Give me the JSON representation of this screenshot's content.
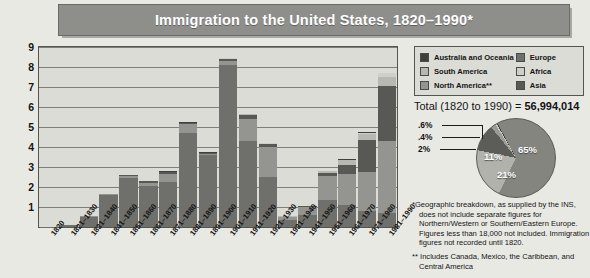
{
  "title": "Immigration to the United States, 1820–1990*",
  "legend": {
    "items": [
      {
        "label": "Australia and Oceania",
        "color": "#3f3f3d"
      },
      {
        "label": "Europe",
        "color": "#6f6f6b"
      },
      {
        "label": "South America",
        "color": "#b8b8b2"
      },
      {
        "label": "Africa",
        "color": "#cfcfc9"
      },
      {
        "label": "North America**",
        "color": "#949490"
      },
      {
        "label": "Asia",
        "color": "#585855"
      }
    ]
  },
  "total": {
    "prefix": "Total (1820 to 1990) = ",
    "value": "56,994,014"
  },
  "pie_labels": {
    "p06": ".6%",
    "p04": ".4%",
    "p2": "2%",
    "p11": "11%",
    "p21": "21%",
    "p65": "65%"
  },
  "footnotes": {
    "star": "*Geographic breakdown, as supplied by the INS, does not include separate figures for Northern/Western or Southern/Eastern Europe. Figures less than 18,000 not included. Immigration figures not recorded until 1820.",
    "doublestar": "** Includes Canada, Mexico, the Caribbean, and Central America"
  },
  "chart_data": {
    "type": "bar",
    "title": "Immigration to the United States, 1820–1990*",
    "xlabel": "",
    "ylabel": "Millions",
    "ylim": [
      0,
      9
    ],
    "yticks": [
      1,
      2,
      3,
      4,
      5,
      6,
      7,
      8,
      9
    ],
    "grid": true,
    "stacked": true,
    "legend_position": "top-right",
    "categories": [
      "1820",
      "1821–1830",
      "1831–1840",
      "1841–1850",
      "1851–1860",
      "1861–1870",
      "1871–1880",
      "1881–1890",
      "1891–1900",
      "1901–1910",
      "1911–1920",
      "1921–1930",
      "1931–1940",
      "1941–1950",
      "1951–1960",
      "1961–1970",
      "1971–1980",
      "1981–1990"
    ],
    "series": [
      {
        "name": "Europe",
        "color": "#6f6f6b",
        "values": [
          0.01,
          0.1,
          0.5,
          1.6,
          2.45,
          2.05,
          2.25,
          4.7,
          3.6,
          8.1,
          4.3,
          2.5,
          0.35,
          0.62,
          1.35,
          1.1,
          0.78,
          0.7
        ]
      },
      {
        "name": "North America**",
        "color": "#949490",
        "values": [
          0.0,
          0.02,
          0.03,
          0.06,
          0.12,
          0.17,
          0.4,
          0.45,
          0.05,
          0.2,
          1.1,
          1.52,
          0.15,
          0.37,
          1.2,
          1.55,
          1.98,
          3.6
        ]
      },
      {
        "name": "Asia",
        "color": "#585855",
        "values": [
          0.0,
          0.0,
          0.0,
          0.0,
          0.04,
          0.06,
          0.12,
          0.07,
          0.07,
          0.1,
          0.2,
          0.11,
          0.02,
          0.04,
          0.15,
          0.43,
          1.59,
          2.74
        ]
      },
      {
        "name": "South America",
        "color": "#b8b8b2",
        "values": [
          0.0,
          0.0,
          0.0,
          0.0,
          0.0,
          0.0,
          0.0,
          0.0,
          0.0,
          0.02,
          0.04,
          0.04,
          0.01,
          0.02,
          0.08,
          0.26,
          0.29,
          0.46
        ]
      },
      {
        "name": "Africa",
        "color": "#cfcfc9",
        "values": [
          0.0,
          0.0,
          0.0,
          0.0,
          0.0,
          0.0,
          0.0,
          0.0,
          0.0,
          0.01,
          0.01,
          0.01,
          0.0,
          0.01,
          0.01,
          0.03,
          0.08,
          0.18
        ]
      },
      {
        "name": "Australia and Oceania",
        "color": "#3f3f3d",
        "values": [
          0.0,
          0.0,
          0.0,
          0.0,
          0.0,
          0.01,
          0.01,
          0.01,
          0.01,
          0.02,
          0.01,
          0.01,
          0.0,
          0.01,
          0.01,
          0.03,
          0.04,
          0.04
        ]
      }
    ]
  },
  "pie_data": {
    "type": "pie",
    "slices": [
      {
        "name": "Europe",
        "percent": 65,
        "color": "#85857f",
        "label": "65%"
      },
      {
        "name": "North America**",
        "percent": 21,
        "color": "#b2b2ac",
        "label": "21%"
      },
      {
        "name": "Asia",
        "percent": 11,
        "color": "#5c5c58",
        "label": "11%"
      },
      {
        "name": "South America",
        "percent": 2,
        "color": "#9b9b95",
        "label": "2%"
      },
      {
        "name": "Africa",
        "percent": 0.6,
        "color": "#cbcbc5",
        "label": ".6%"
      },
      {
        "name": "Australia and Oceania",
        "percent": 0.4,
        "color": "#3d3d3a",
        "label": ".4%"
      }
    ]
  }
}
